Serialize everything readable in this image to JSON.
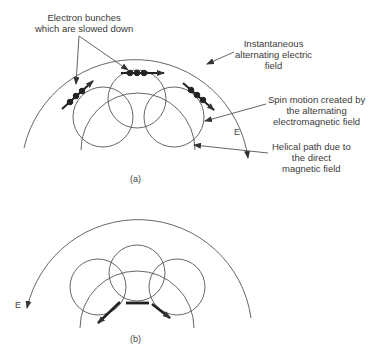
{
  "diagram": {
    "panel_a": {
      "caption": "(a)",
      "field_label": "E",
      "annotations": {
        "electron_bunches": [
          "Electron bunches",
          "which are slowed down"
        ],
        "electric_field": [
          "Instantaneous",
          "alternating electric",
          "field"
        ],
        "spin_motion": [
          "Spin motion created by",
          "the alternating",
          "electromagnetic field"
        ],
        "helical_path": [
          "Helical path due to",
          "the direct",
          "magnetic field"
        ]
      }
    },
    "panel_b": {
      "caption": "(b)",
      "field_label": "E"
    },
    "colors": {
      "line": "#555555",
      "bunch": "#222222",
      "text": "#3a3a3a"
    }
  }
}
